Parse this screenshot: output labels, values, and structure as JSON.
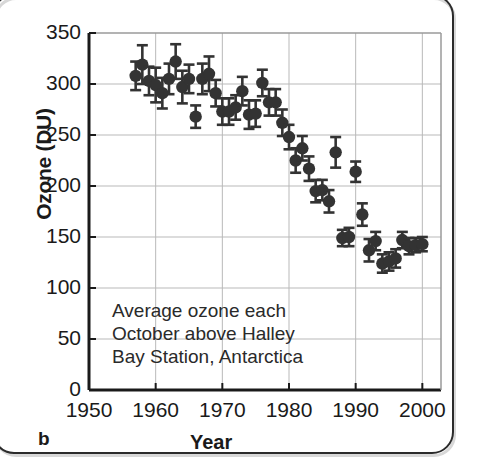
{
  "panel": {
    "letter": "b"
  },
  "chart_data": {
    "type": "scatter",
    "title": "",
    "xlabel": "Year",
    "ylabel": "Ozone (DU)",
    "xlim": [
      1950,
      2002
    ],
    "ylim": [
      0,
      350
    ],
    "grid": true,
    "legend": null,
    "annotation": [
      "Average ozone each",
      "October above Halley",
      "Bay Station, Antarctica"
    ],
    "xticks": [
      1950,
      1960,
      1970,
      1980,
      1990,
      2000
    ],
    "yticks": [
      0,
      50,
      100,
      150,
      200,
      250,
      300,
      350
    ],
    "xtick_labels": [
      "1950",
      "1960",
      "1970",
      "1980",
      "1990",
      "2000"
    ],
    "ytick_labels": [
      "0",
      "50",
      "100",
      "150",
      "200",
      "250",
      "300",
      "350"
    ],
    "series": [
      {
        "name": "Average October ozone, Halley Bay Station",
        "marker": "filled-circle",
        "color": "#333333",
        "errorbars": true,
        "x": [
          1957,
          1958,
          1959,
          1960,
          1961,
          1962,
          1963,
          1964,
          1965,
          1966,
          1967,
          1968,
          1969,
          1970,
          1971,
          1972,
          1973,
          1974,
          1975,
          1976,
          1977,
          1978,
          1979,
          1980,
          1981,
          1982,
          1983,
          1984,
          1985,
          1986,
          1987,
          1988,
          1989,
          1990,
          1991,
          1992,
          1993,
          1994,
          1995,
          1996,
          1997,
          1998,
          1999,
          2000
        ],
        "y": [
          308,
          319,
          303,
          299,
          291,
          305,
          322,
          297,
          305,
          268,
          305,
          310,
          291,
          273,
          273,
          277,
          293,
          270,
          271,
          301,
          282,
          282,
          262,
          248,
          225,
          237,
          217,
          195,
          196,
          185,
          233,
          149,
          150,
          214,
          172,
          137,
          146,
          124,
          126,
          129,
          147,
          141,
          142,
          143
        ],
        "yerr": [
          14,
          19,
          14,
          17,
          15,
          15,
          17,
          16,
          14,
          11,
          15,
          17,
          13,
          13,
          13,
          12,
          14,
          14,
          13,
          13,
          13,
          13,
          13,
          12,
          12,
          12,
          12,
          11,
          10,
          11,
          15,
          8,
          9,
          10,
          11,
          11,
          9,
          9,
          9,
          9,
          8,
          8,
          7,
          7
        ]
      }
    ]
  }
}
